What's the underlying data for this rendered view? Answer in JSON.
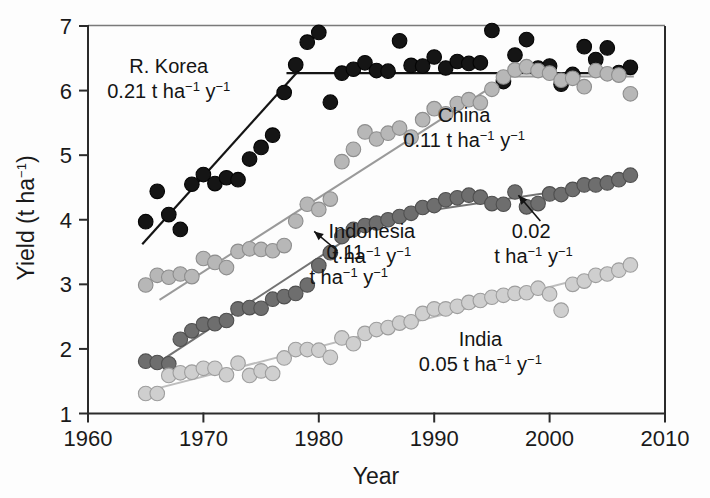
{
  "chart_data": {
    "type": "scatter",
    "title": "",
    "xlabel": "Year",
    "ylabel": "Yield (t ha⁻¹)",
    "xlim": [
      1960,
      2010
    ],
    "ylim": [
      1,
      7
    ],
    "xticks": [
      1960,
      1970,
      1980,
      1990,
      2000,
      2010
    ],
    "yticks": [
      1,
      2,
      3,
      4,
      5,
      6,
      7
    ],
    "grid": false,
    "legend": "inline annotations",
    "series": [
      {
        "name": "R. Korea",
        "color": "#151515",
        "marker": "filled circle",
        "rate_label": "0.21 t ha⁻¹ y⁻¹",
        "rate_value": 0.21,
        "x": [
          1965,
          1966,
          1967,
          1968,
          1969,
          1970,
          1971,
          1972,
          1973,
          1974,
          1975,
          1976,
          1977,
          1978,
          1979,
          1980,
          1981,
          1982,
          1983,
          1984,
          1985,
          1986,
          1987,
          1988,
          1989,
          1990,
          1991,
          1992,
          1993,
          1994,
          1995,
          1996,
          1997,
          1998,
          1999,
          2000,
          2001,
          2002,
          2003,
          2004,
          2005,
          2006,
          2007
        ],
        "y": [
          3.97,
          4.44,
          4.08,
          3.85,
          4.55,
          4.7,
          4.56,
          4.65,
          4.62,
          4.94,
          5.12,
          5.31,
          5.97,
          6.4,
          6.75,
          6.9,
          5.82,
          6.27,
          6.33,
          6.43,
          6.31,
          6.3,
          6.77,
          6.39,
          6.38,
          6.52,
          6.35,
          6.45,
          6.42,
          6.43,
          6.93,
          6.14,
          6.55,
          6.79,
          6.35,
          6.38,
          6.1,
          6.25,
          6.68,
          6.48,
          6.66,
          6.28,
          6.36
        ]
      },
      {
        "name": "China",
        "color": "#b7b7b7",
        "marker": "filled circle light gray",
        "rate_label": "0.11 t ha⁻¹ y⁻¹",
        "rate_value": 0.11,
        "x": [
          1965,
          1966,
          1967,
          1968,
          1969,
          1970,
          1971,
          1972,
          1973,
          1974,
          1975,
          1976,
          1977,
          1978,
          1979,
          1980,
          1981,
          1982,
          1983,
          1984,
          1985,
          1986,
          1987,
          1988,
          1989,
          1990,
          1991,
          1992,
          1993,
          1994,
          1995,
          1996,
          1997,
          1998,
          1999,
          2000,
          2001,
          2002,
          2003,
          2004,
          2005,
          2006,
          2007
        ],
        "y": [
          2.99,
          3.14,
          3.11,
          3.16,
          3.12,
          3.4,
          3.34,
          3.26,
          3.51,
          3.55,
          3.54,
          3.52,
          3.6,
          3.98,
          4.24,
          4.16,
          4.32,
          4.9,
          5.09,
          5.36,
          5.25,
          5.34,
          5.42,
          5.28,
          5.55,
          5.72,
          5.64,
          5.8,
          5.86,
          5.81,
          6.02,
          6.21,
          6.32,
          6.37,
          6.31,
          6.27,
          6.16,
          6.19,
          6.06,
          6.31,
          6.26,
          6.24,
          5.95
        ]
      },
      {
        "name": "Indonesia",
        "color": "#6e6e6e",
        "marker": "filled circle dark gray",
        "rate_label": "0.11 t ha⁻¹ y⁻¹",
        "rate_value": 0.11,
        "rate_label_2": "0.02 t ha⁻¹ y⁻¹",
        "rate_value_2": 0.02,
        "x": [
          1965,
          1966,
          1967,
          1968,
          1969,
          1970,
          1971,
          1972,
          1973,
          1974,
          1975,
          1976,
          1977,
          1978,
          1979,
          1980,
          1981,
          1982,
          1983,
          1984,
          1985,
          1986,
          1987,
          1988,
          1989,
          1990,
          1991,
          1992,
          1993,
          1994,
          1995,
          1996,
          1997,
          1998,
          1999,
          2000,
          2001,
          2002,
          2003,
          2004,
          2005,
          2006,
          2007
        ],
        "y": [
          1.81,
          1.79,
          1.77,
          2.15,
          2.28,
          2.38,
          2.39,
          2.44,
          2.62,
          2.64,
          2.63,
          2.77,
          2.81,
          2.86,
          2.99,
          3.29,
          3.49,
          3.74,
          3.85,
          3.91,
          3.95,
          4.0,
          4.05,
          4.1,
          4.19,
          4.22,
          4.31,
          4.34,
          4.38,
          4.35,
          4.25,
          4.24,
          4.43,
          4.2,
          4.25,
          4.4,
          4.39,
          4.47,
          4.54,
          4.54,
          4.57,
          4.62,
          4.69
        ]
      },
      {
        "name": "India",
        "color": "#cfcfcf",
        "marker": "open/light circle",
        "rate_label": "0.05 t ha⁻¹ y⁻¹",
        "rate_value": 0.05,
        "x": [
          1965,
          1966,
          1967,
          1968,
          1969,
          1970,
          1971,
          1972,
          1973,
          1974,
          1975,
          1976,
          1977,
          1978,
          1979,
          1980,
          1981,
          1982,
          1983,
          1984,
          1985,
          1986,
          1987,
          1988,
          1989,
          1990,
          1991,
          1992,
          1993,
          1994,
          1995,
          1996,
          1997,
          1998,
          1999,
          2000,
          2001,
          2002,
          2003,
          2004,
          2005,
          2006,
          2007
        ],
        "y": [
          1.31,
          1.31,
          1.59,
          1.63,
          1.64,
          1.7,
          1.7,
          1.6,
          1.78,
          1.59,
          1.66,
          1.62,
          1.86,
          1.99,
          1.99,
          1.98,
          1.87,
          2.17,
          2.08,
          2.24,
          2.3,
          2.33,
          2.4,
          2.42,
          2.55,
          2.62,
          2.62,
          2.66,
          2.72,
          2.75,
          2.8,
          2.83,
          2.86,
          2.87,
          2.94,
          2.85,
          2.6,
          3.0,
          3.05,
          3.14,
          3.16,
          3.22,
          3.3
        ]
      }
    ],
    "trendlines": [
      {
        "series": "R. Korea",
        "segment": 1,
        "x0": 1964.7,
        "y0": 3.62,
        "x1": 1978.3,
        "y1": 6.32,
        "color": "#151515",
        "width": 2.2
      },
      {
        "series": "R. Korea",
        "segment": 2,
        "x0": 1977.2,
        "y0": 6.27,
        "x1": 2007.4,
        "y1": 6.27,
        "color": "#151515",
        "width": 2.2
      },
      {
        "series": "China",
        "segment": 1,
        "x0": 1966.2,
        "y0": 2.76,
        "x1": 1996.4,
        "y1": 6.22,
        "color": "#9a9a9a",
        "width": 2.0
      },
      {
        "series": "China",
        "segment": 2,
        "x0": 1995.6,
        "y0": 6.22,
        "x1": 2007.3,
        "y1": 6.22,
        "color": "#9a9a9a",
        "width": 2.0
      },
      {
        "series": "Indonesia",
        "segment": 1,
        "x0": 1966.6,
        "y0": 1.85,
        "x1": 1985.0,
        "y1": 4.0,
        "color": "#737373",
        "width": 2.0
      },
      {
        "series": "Indonesia",
        "segment": 2,
        "x0": 1984.2,
        "y0": 4.0,
        "x1": 2007.4,
        "y1": 4.62,
        "color": "#737373",
        "width": 2.0
      },
      {
        "series": "India",
        "segment": 1,
        "x0": 1965.6,
        "y0": 1.37,
        "x1": 2007.4,
        "y1": 3.3,
        "color": "#bdbdbd",
        "width": 2.0
      }
    ],
    "annotations": [
      {
        "id": "korea",
        "line1": "R. Korea",
        "line2_num": "0.21",
        "line2_unit": "t ha",
        "line2_sup1": "−1",
        "line2_y": "y",
        "line2_sup2": "−1",
        "x": 1966.5,
        "y": 6.45
      },
      {
        "id": "china",
        "line1": "China",
        "line2_num": "0.11",
        "line2_unit": "t ha",
        "line2_sup1": "−1",
        "line2_y": "y",
        "line2_sup2": "−1",
        "x": 1992.0,
        "y": 5.6
      },
      {
        "id": "indonesia",
        "line1": "Indonesia",
        "line2_num": "0.11",
        "line2_unit": "t ha",
        "line2_sup1": "−1",
        "line2_y": "y",
        "line2_sup2": "−1",
        "x": 1982.0,
        "y": 3.85
      },
      {
        "id": "indonesia2",
        "line1": "0.02",
        "line2_unit": "t ha",
        "line2_sup1": "−1",
        "line2_y": "y",
        "line2_sup2": "−1",
        "x": 1998.0,
        "y": 3.85
      },
      {
        "id": "india",
        "line1": "India",
        "line2_num": "0.05",
        "line2_unit": "t ha",
        "line2_sup1": "−1",
        "line2_y": "y",
        "line2_sup2": "−1",
        "x": 1993.5,
        "y": 2.1
      }
    ]
  },
  "axes": {
    "x_title": "Year",
    "y_title_main": "Yield (t ha",
    "y_title_sup": "−1",
    "y_title_close": ")",
    "x_tick_labels": [
      "1960",
      "1970",
      "1980",
      "1990",
      "2000",
      "2010"
    ],
    "y_tick_labels": [
      "1",
      "2",
      "3",
      "4",
      "5",
      "6",
      "7"
    ]
  },
  "labels": {
    "korea_name": "R. Korea",
    "korea_rate_num": "0.21",
    "china_name": "China",
    "china_rate_num": "0.11",
    "indonesia_name": "Indonesia",
    "indonesia_rate_num": "0.11",
    "indonesia_rate2_num": "0.02",
    "india_name": "India",
    "india_rate_num": "0.05",
    "unit_t_ha": "t ha",
    "unit_sup": "−1",
    "unit_y": "y",
    "india_rate_full": "0.05 t ha",
    "china_rate_full": "0.11 t ha",
    "korea_rate_full": "0.21 t ha"
  },
  "colors": {
    "korea": "#151515",
    "china": "#b7b7b7",
    "indonesia": "#6e6e6e",
    "india": "#cfcfcf",
    "axis": "#2b2b2b",
    "background": "#fdfdfd"
  }
}
